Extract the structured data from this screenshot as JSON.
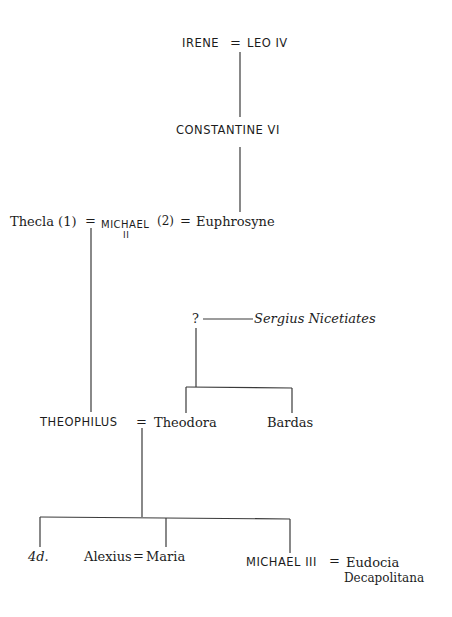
{
  "diagram": {
    "type": "family-tree",
    "nodes": {
      "irene": "IRENE",
      "eq1": "=",
      "leo": "LEO IV",
      "constantine": "CONSTANTINE VI",
      "thecla": "Thecla (1)",
      "eq2": "=",
      "michael2": "MICHAEL",
      "michael2_num": "II",
      "wife2": "(2)",
      "eq3": "=",
      "euphrosyne": "Euphrosyne",
      "unknown": "?",
      "sergius": "Sergius Nicetiates",
      "theophilus": "THEOPHILUS",
      "eq4": "=",
      "theodora": "Theodora",
      "bardas": "Bardas",
      "daughters": "4d.",
      "alexius": "Alexius",
      "eq5": "=",
      "maria": "Maria",
      "michael3": "MICHAEL III",
      "eq6": "=",
      "eudocia": "Eudocia",
      "eudocia2": "Decapolitana"
    },
    "line_color": "#3a3a3a"
  }
}
